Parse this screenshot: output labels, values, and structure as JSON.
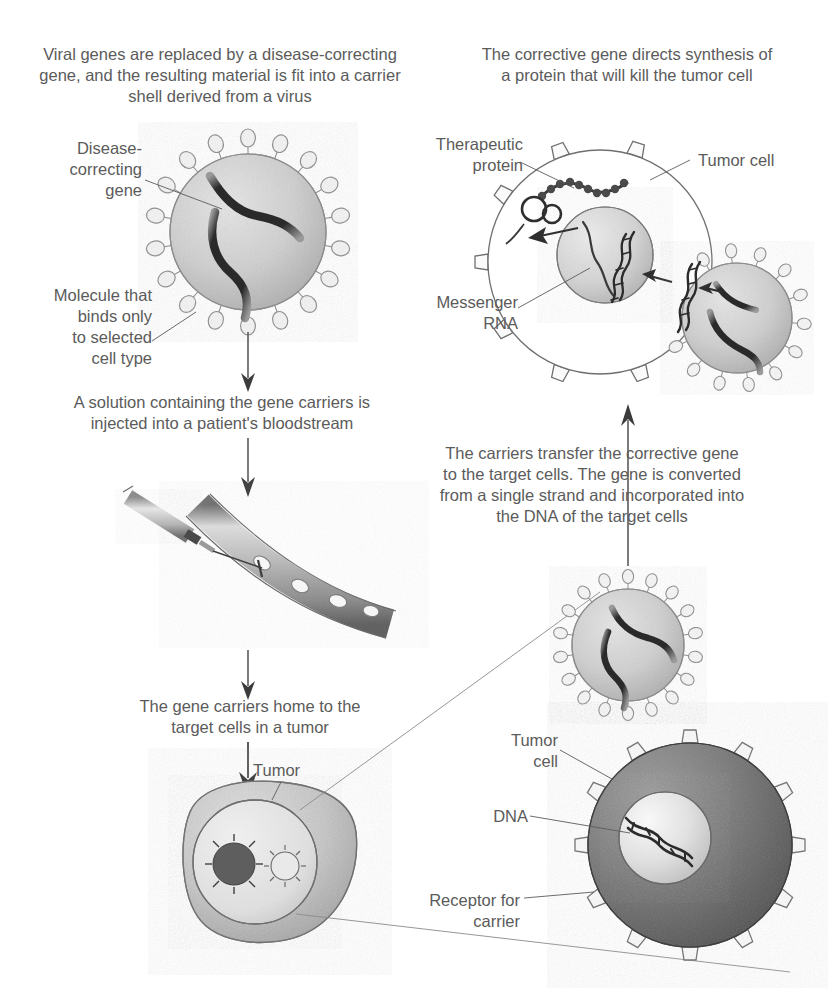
{
  "figure": {
    "type": "scientific-illustration",
    "background_color": "#ffffff",
    "ink_color": "#5b5b5b"
  },
  "captions": [
    {
      "id": "step1",
      "name": "caption-viral-genes-replaced",
      "text": "Viral genes are replaced by a disease-correcting\ngene, and the resulting material is fit into a carrier\nshell derived from a virus",
      "x": 30,
      "y": 44,
      "width": 380
    },
    {
      "id": "step2",
      "name": "caption-solution-injected",
      "text": "A solution containing the gene carriers is\ninjected into a patient's bloodstream",
      "x": 52,
      "y": 392,
      "width": 340
    },
    {
      "id": "step3",
      "name": "caption-carriers-home-to-tumor",
      "text": "The gene carriers home to the\ntarget cells in a tumor",
      "x": 110,
      "y": 696,
      "width": 280
    },
    {
      "id": "step4",
      "name": "caption-carriers-transfer-gene",
      "text": "The carriers transfer the corrective gene\nto the target cells. The gene is converted\nfrom a single strand and incorporated into\nthe DNA of the target cells",
      "x": 392,
      "y": 443,
      "width": 400
    },
    {
      "id": "step5",
      "name": "caption-corrective-gene-synthesis",
      "text": "The corrective gene directs synthesis of\na protein that will kill the tumor cell",
      "x": 452,
      "y": 44,
      "width": 350
    }
  ],
  "callouts": [
    {
      "id": "disease_correcting_gene",
      "name": "label-disease-correcting-gene",
      "text": "Disease-\ncorrecting\ngene",
      "x": 32,
      "y": 138,
      "width": 110,
      "align": "right"
    },
    {
      "id": "molecule_binds",
      "name": "label-molecule-that-binds",
      "text": "Molecule that\nbinds only\nto selected\ncell type",
      "x": 22,
      "y": 285,
      "width": 130,
      "align": "right"
    },
    {
      "id": "therapeutic_protein",
      "name": "label-therapeutic-protein",
      "text": "Therapeutic\nprotein",
      "x": 408,
      "y": 134,
      "width": 115,
      "align": "right"
    },
    {
      "id": "tumor_cell_top",
      "name": "label-tumor-cell-top",
      "text": "Tumor cell",
      "x": 698,
      "y": 150,
      "width": 100,
      "align": "left"
    },
    {
      "id": "messenger_rna",
      "name": "label-messenger-rna",
      "text": "Messenger\nRNA",
      "x": 408,
      "y": 292,
      "width": 110,
      "align": "right"
    },
    {
      "id": "tumor",
      "name": "label-tumor",
      "text": "Tumor",
      "x": 253,
      "y": 760,
      "width": 70,
      "align": "left"
    },
    {
      "id": "tumor_cell_bottom",
      "name": "label-tumor-cell-bottom",
      "text": "Tumor\ncell",
      "x": 483,
      "y": 730,
      "width": 75,
      "align": "right"
    },
    {
      "id": "dna",
      "name": "label-dna",
      "text": "DNA",
      "x": 468,
      "y": 806,
      "width": 60,
      "align": "right"
    },
    {
      "id": "receptor_for_carrier",
      "name": "label-receptor-for-carrier",
      "text": "Receptor for\ncarrier",
      "x": 395,
      "y": 890,
      "width": 125,
      "align": "right"
    }
  ],
  "elements": {
    "virus_top_left": {
      "name": "virus-carrier-particle-top",
      "cx": 248,
      "cy": 232,
      "r": 78,
      "spikes": 18
    },
    "virus_mid_right": {
      "name": "virus-carrier-particle-mid",
      "cx": 628,
      "cy": 645,
      "r": 56,
      "spikes": 18
    },
    "virus_entering_cell": {
      "name": "virus-carrier-particle-entering",
      "cx": 735,
      "cy": 315,
      "r": 55,
      "spikes": 14
    },
    "tumor_cell_top": {
      "name": "tumor-cell-top",
      "cx": 600,
      "cy": 262,
      "r": 112
    },
    "nucleus_top": {
      "name": "nucleus-top",
      "cx": 605,
      "cy": 255,
      "r": 48
    },
    "tumor_cell_bottom": {
      "name": "tumor-cell-bottom",
      "cx": 690,
      "cy": 845,
      "r": 102
    },
    "nucleus_bottom": {
      "name": "nucleus-bottom",
      "cx": 665,
      "cy": 835,
      "r": 45
    },
    "syringe": {
      "name": "syringe"
    },
    "blood_vessel": {
      "name": "blood-vessel"
    },
    "tumor_mass": {
      "name": "tumor-mass",
      "cx": 275,
      "cy": 855
    },
    "arrow_down_1": {
      "name": "arrow-down-injection"
    },
    "arrow_down_2": {
      "name": "arrow-down-to-tumor"
    },
    "arrow_up_right": {
      "name": "arrow-up-to-cell"
    }
  }
}
